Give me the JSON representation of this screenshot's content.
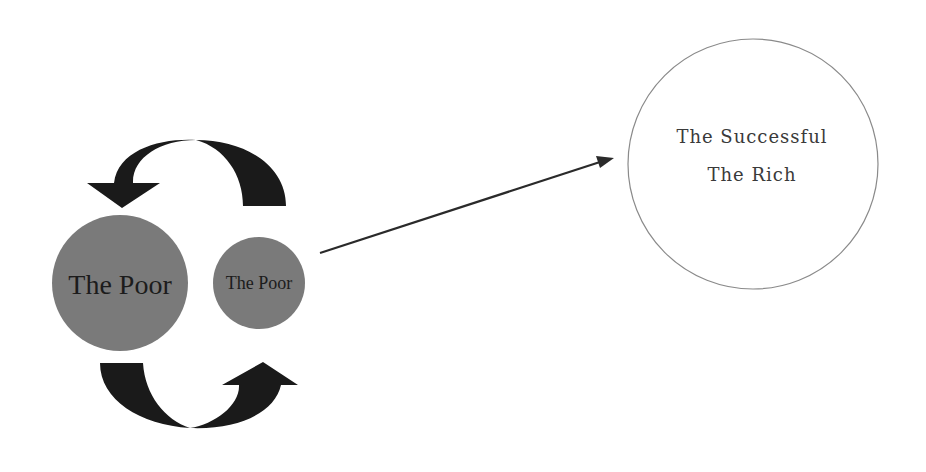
{
  "diagram": {
    "type": "flow",
    "colors": {
      "background": "#ffffff",
      "poor_circle_fill": "#7a7a7a",
      "cycle_arrow_fill": "#1a1a1a",
      "line_arrow": "#2a2a2a",
      "rich_circle_stroke": "#8a8a8a",
      "text": "#1c1c1c"
    },
    "poor_cycle": {
      "large_circle_label": "The Poor",
      "small_circle_label": "The Poor"
    },
    "target": {
      "line1": "The Successful",
      "line2": "The Rich"
    }
  }
}
